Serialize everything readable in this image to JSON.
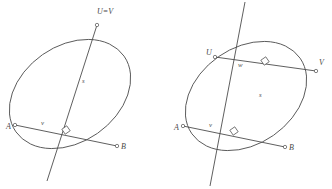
{
  "figure": {
    "background_color": "#ffffff",
    "stroke_color": "#4d4d4d",
    "label_color": "#4a4a4a",
    "width": 332,
    "height": 189
  },
  "diagrams": [
    {
      "id": "left-diagram",
      "name": "degenerate-chord-diagram",
      "description": "Ellipse with chord AB, perpendicular axis s through coincident points U and V at the top",
      "ellipse": {
        "cx": 70,
        "cy": 94,
        "rx": 66,
        "ry": 48,
        "rotation": -35
      },
      "labels": [
        {
          "key": "uv",
          "text": "U=V",
          "x": 97,
          "y": 14,
          "style": "cap"
        },
        {
          "key": "s",
          "text": "s",
          "x": 82,
          "y": 83,
          "style": "small"
        },
        {
          "key": "a",
          "text": "A",
          "x": 6,
          "y": 129,
          "style": "cap"
        },
        {
          "key": "v",
          "text": "v",
          "x": 41,
          "y": 125,
          "style": "small"
        },
        {
          "key": "b",
          "text": "B",
          "x": 121,
          "y": 149,
          "style": "cap"
        }
      ],
      "points": [
        {
          "key": "uv_point",
          "name": "point-uv",
          "x": 97,
          "y": 25
        },
        {
          "key": "a_point",
          "name": "point-a",
          "x": 15,
          "y": 125
        },
        {
          "key": "b_point",
          "name": "point-b",
          "x": 117,
          "y": 146
        }
      ],
      "segments": [
        {
          "key": "chord_ab",
          "name": "chord-ab",
          "x1": 15,
          "y1": 125,
          "x2": 117,
          "y2": 146
        },
        {
          "key": "axis_s",
          "name": "axis-s",
          "x1": 97,
          "y1": 25,
          "x2": 47,
          "y2": 181
        }
      ],
      "right_angle": {
        "key": "right_angle",
        "name": "right-angle-mark",
        "x": 66,
        "y": 130,
        "size": 6,
        "rotation": -35
      }
    },
    {
      "id": "right-diagram",
      "name": "two-chord-diagram",
      "description": "Ellipse with chords UV and AB both perpendicular to the common axis s",
      "ellipse": {
        "cx": 246,
        "cy": 96,
        "rx": 66,
        "ry": 48,
        "rotation": -35
      },
      "labels": [
        {
          "key": "u",
          "text": "U",
          "x": 206,
          "y": 55,
          "style": "cap"
        },
        {
          "key": "w",
          "text": "w",
          "x": 238,
          "y": 67,
          "style": "small"
        },
        {
          "key": "v",
          "text": "V",
          "x": 319,
          "y": 65,
          "style": "cap"
        },
        {
          "key": "s",
          "text": "s",
          "x": 259,
          "y": 97,
          "style": "small"
        },
        {
          "key": "a",
          "text": "A",
          "x": 174,
          "y": 130,
          "style": "cap"
        },
        {
          "key": "v_lower",
          "text": "v",
          "x": 209,
          "y": 127,
          "style": "small"
        },
        {
          "key": "b",
          "text": "B",
          "x": 289,
          "y": 150,
          "style": "cap"
        }
      ],
      "points": [
        {
          "key": "u_point",
          "name": "point-u",
          "x": 215,
          "y": 57
        },
        {
          "key": "v_point",
          "name": "point-v",
          "x": 316,
          "y": 71
        },
        {
          "key": "a_point",
          "name": "point-a",
          "x": 183,
          "y": 126
        },
        {
          "key": "b_point",
          "name": "point-b",
          "x": 285,
          "y": 147
        }
      ],
      "segments": [
        {
          "key": "chord_uv",
          "name": "chord-uv",
          "x1": 215,
          "y1": 57,
          "x2": 316,
          "y2": 71
        },
        {
          "key": "chord_ab",
          "name": "chord-ab",
          "x1": 183,
          "y1": 126,
          "x2": 285,
          "y2": 147
        },
        {
          "key": "axis_s",
          "name": "axis-s",
          "x1": 245,
          "y1": 2,
          "x2": 210,
          "y2": 186
        }
      ],
      "right_angles": [
        {
          "key": "right_angle_upper",
          "name": "right-angle-mark-upper",
          "x": 265,
          "y": 61,
          "size": 6,
          "rotation": -35
        },
        {
          "key": "right_angle_lower",
          "name": "right-angle-mark-lower",
          "x": 234,
          "y": 131,
          "size": 6,
          "rotation": -35
        }
      ]
    }
  ]
}
